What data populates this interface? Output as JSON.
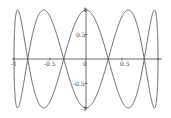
{
  "chart_data": {
    "type": "line",
    "title": "",
    "xlabel": "",
    "ylabel": "",
    "parametric": {
      "x": "sin(t)",
      "y": "cos(5t)",
      "t_range": [
        0,
        6.2832
      ]
    },
    "xlim": [
      -1,
      1
    ],
    "ylim": [
      -1,
      1
    ],
    "x_ticks": [
      "-1",
      "-0.5",
      "0",
      "0.5"
    ],
    "y_ticks": [
      "1",
      "0.5",
      "-0.5",
      "-1"
    ],
    "grid": false,
    "legend": null,
    "series": [
      {
        "name": "curve",
        "x": [
          -1,
          -0.951,
          -0.809,
          -0.588,
          -0.309,
          0,
          0.309,
          0.588,
          0.809,
          0.951,
          1
        ],
        "y_branch_a": [
          0,
          1,
          0,
          -1,
          0,
          1,
          0,
          -1,
          0,
          1,
          0
        ],
        "y_branch_b": [
          0,
          -1,
          0,
          1,
          0,
          -1,
          0,
          1,
          0,
          -1,
          0
        ]
      }
    ],
    "line_color": "#555555"
  },
  "labels": {
    "x_neg1": "-1",
    "x_neg05": "-0.5",
    "x_0": "0",
    "x_05": "0.5",
    "y_1": "1",
    "y_05": "0.5",
    "y_neg05": "-0.5",
    "y_neg1": "-1"
  }
}
